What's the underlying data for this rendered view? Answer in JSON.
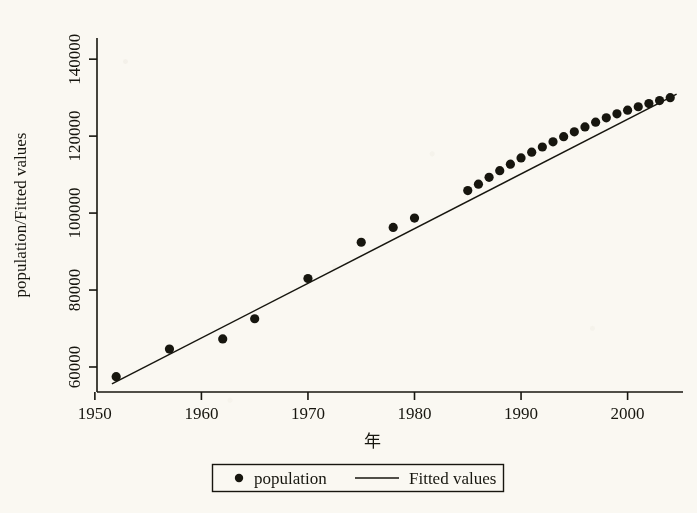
{
  "figure": {
    "background_color": "#faf8f2",
    "ink_color": "#17160f",
    "axis_title_y": "population/Fitted values",
    "axis_title_x": "年"
  },
  "legend": {
    "marker_label": "population",
    "line_label": "Fitted values",
    "marker_icon": "filled-circle-marker",
    "line_icon": "solid-line-swatch"
  },
  "chart_data": {
    "type": "scatter",
    "title": "",
    "subtitle": "",
    "xlabel": "年",
    "ylabel": "population/Fitted values",
    "xlim": [
      1950.2,
      2005.2
    ],
    "ylim": [
      53500,
      145500
    ],
    "grid": false,
    "legend_position": "below-axis-center",
    "xticks": [
      1950,
      1960,
      1970,
      1980,
      1990,
      2000
    ],
    "xticklabels": [
      "1950",
      "1960",
      "1970",
      "1980",
      "1990",
      "2000"
    ],
    "yticks": [
      60000,
      80000,
      100000,
      120000,
      140000
    ],
    "yticklabels": [
      "60000",
      "80000",
      "100000",
      "120000",
      "140000"
    ],
    "series": [
      {
        "name": "population",
        "type": "scatter",
        "marker": "filled-circle",
        "color": "#17160f",
        "x": [
          1952,
          1957,
          1962,
          1965,
          1970,
          1975,
          1978,
          1980,
          1985,
          1986,
          1987,
          1988,
          1989,
          1990,
          1991,
          1992,
          1993,
          1994,
          1995,
          1996,
          1997,
          1998,
          1999,
          2000,
          2001,
          2002,
          2003,
          2004
        ],
        "y": [
          57482,
          64653,
          67295,
          72538,
          82992,
          92420,
          96259,
          98705,
          105851,
          107507,
          109300,
          111026,
          112704,
          114333,
          115823,
          117171,
          118517,
          119850,
          121121,
          122389,
          123626,
          124761,
          125786,
          126743,
          127627,
          128453,
          129227,
          129988
        ]
      },
      {
        "name": "Fitted values",
        "type": "line",
        "color": "#17160f",
        "x": [
          1951.6,
          2004.6
        ],
        "y": [
          55600,
          130900
        ]
      }
    ]
  }
}
